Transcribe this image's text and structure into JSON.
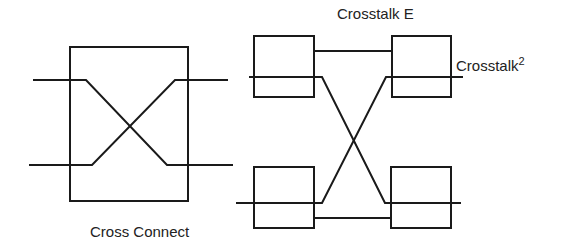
{
  "labels": {
    "cross_connect": "Cross Connect",
    "crosstalk_e": "Crosstalk E",
    "crosstalk_sq_base": "Crosstalk",
    "crosstalk_sq_exp": "2"
  },
  "colors": {
    "stroke": "#1a1a1a",
    "text": "#222222",
    "background": "#ffffff"
  }
}
